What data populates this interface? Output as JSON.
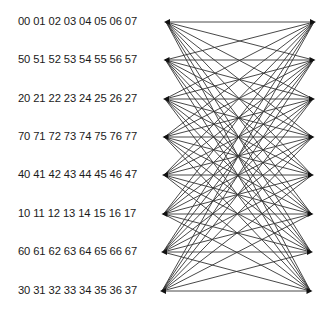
{
  "diagram": {
    "type": "complete-bipartite-network",
    "rows": [
      {
        "label": "00 01 02 03 04 05 06 07",
        "y": 22
      },
      {
        "label": "50 51 52 53 54 55 56 57",
        "y": 60
      },
      {
        "label": "20 21 22 23 24 25 26 27",
        "y": 99
      },
      {
        "label": "70 71 72 73 74 75 76 77",
        "y": 137
      },
      {
        "label": "40 41 42 43 44 45 46 47",
        "y": 175
      },
      {
        "label": "10 11 12 13 14 15 16 17",
        "y": 214
      },
      {
        "label": "60 61 62 63 64 65 66 67",
        "y": 252
      },
      {
        "label": "30 31 32 33 34 35 36 37",
        "y": 291
      }
    ],
    "left_nodes": [
      {
        "x": 166,
        "y": 22
      },
      {
        "x": 165.5,
        "y": 60
      },
      {
        "x": 165,
        "y": 99
      },
      {
        "x": 164.5,
        "y": 137
      },
      {
        "x": 164,
        "y": 175
      },
      {
        "x": 163.5,
        "y": 214
      },
      {
        "x": 163,
        "y": 252
      },
      {
        "x": 162,
        "y": 291
      }
    ],
    "right_nodes": [
      {
        "x": 314,
        "y": 22
      },
      {
        "x": 313.5,
        "y": 60
      },
      {
        "x": 313,
        "y": 99
      },
      {
        "x": 312.5,
        "y": 137
      },
      {
        "x": 312,
        "y": 175
      },
      {
        "x": 311.5,
        "y": 214
      },
      {
        "x": 311,
        "y": 252
      },
      {
        "x": 310.5,
        "y": 291
      }
    ],
    "edge_color": "#333333",
    "node_color": "#111111"
  }
}
